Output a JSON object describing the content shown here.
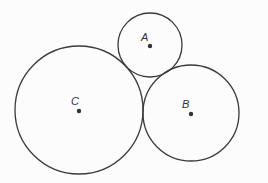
{
  "diagram": {
    "type": "tangent-circles",
    "colors": {
      "stroke": "#3a3a3a",
      "center_dot": "#333333",
      "label": "#333333",
      "background": "#fcfcfc"
    },
    "circles": [
      {
        "label": "A",
        "cx": 150,
        "cy": 45,
        "r": 32,
        "label_x": 141,
        "label_y": 41
      },
      {
        "label": "B",
        "cx": 191,
        "cy": 113,
        "r": 48,
        "label_x": 182,
        "label_y": 108
      },
      {
        "label": "C",
        "cx": 79,
        "cy": 110,
        "r": 64,
        "label_x": 71,
        "label_y": 105
      }
    ]
  }
}
